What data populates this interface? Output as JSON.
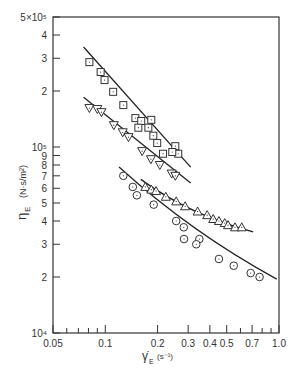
{
  "chart_data": {
    "type": "scatter",
    "title": "",
    "xlabel": "γ̇_E (s⁻¹)",
    "ylabel": "η_E (N·s/m²)",
    "xscale": "log",
    "yscale": "log",
    "xlim": [
      0.05,
      1.0
    ],
    "ylim": [
      10000,
      500000
    ],
    "grid": false,
    "legend": null,
    "x_ticks": [
      {
        "value": 0.05,
        "label": "0.05"
      },
      {
        "value": 0.1,
        "label": "0.1"
      },
      {
        "value": 0.2,
        "label": "0.2"
      },
      {
        "value": 0.3,
        "label": "0.3"
      },
      {
        "value": 0.4,
        "label": "0.4"
      },
      {
        "value": 0.5,
        "label": "0.5"
      },
      {
        "value": 0.7,
        "label": "0.7"
      },
      {
        "value": 1.0,
        "label": "1.0"
      }
    ],
    "x_minor_ticks": [
      0.06,
      0.07,
      0.08,
      0.09,
      0.6,
      0.8,
      0.9
    ],
    "y_ticks": [
      {
        "value": 10000,
        "label": "10⁴"
      },
      {
        "value": 20000,
        "label": "2"
      },
      {
        "value": 30000,
        "label": "3"
      },
      {
        "value": 40000,
        "label": "4"
      },
      {
        "value": 50000,
        "label": "5"
      },
      {
        "value": 60000,
        "label": "6"
      },
      {
        "value": 70000,
        "label": "7"
      },
      {
        "value": 80000,
        "label": "8"
      },
      {
        "value": 90000,
        "label": "9"
      },
      {
        "value": 100000,
        "label": "10⁵"
      },
      {
        "value": 200000,
        "label": "2"
      },
      {
        "value": 300000,
        "label": "3"
      },
      {
        "value": 400000,
        "label": "4"
      },
      {
        "value": 500000,
        "label": "5×10⁵"
      }
    ],
    "series": [
      {
        "name": "squares",
        "marker": "square",
        "points": [
          [
            0.081,
            286000
          ],
          [
            0.094,
            253000
          ],
          [
            0.099,
            229000
          ],
          [
            0.111,
            198000
          ],
          [
            0.127,
            168000
          ],
          [
            0.149,
            143000
          ],
          [
            0.161,
            138000
          ],
          [
            0.184,
            140000
          ],
          [
            0.155,
            127000
          ],
          [
            0.177,
            127000
          ],
          [
            0.189,
            115000
          ],
          [
            0.199,
            105000
          ],
          [
            0.215,
            92000
          ],
          [
            0.253,
            101000
          ],
          [
            0.263,
            92000
          ],
          [
            0.243,
            94000
          ]
        ],
        "fit_line": [
          [
            0.075,
            345000
          ],
          [
            0.31,
            78000
          ]
        ]
      },
      {
        "name": "triangles-down",
        "marker": "triangle-down",
        "points": [
          [
            0.081,
            162000
          ],
          [
            0.09,
            160000
          ],
          [
            0.095,
            154000
          ],
          [
            0.112,
            131000
          ],
          [
            0.126,
            120000
          ],
          [
            0.136,
            113000
          ],
          [
            0.163,
            95000
          ],
          [
            0.183,
            86000
          ],
          [
            0.206,
            80000
          ],
          [
            0.241,
            72000
          ],
          [
            0.253,
            70000
          ]
        ],
        "fit_line": [
          [
            0.075,
            185000
          ],
          [
            0.31,
            64000
          ]
        ]
      },
      {
        "name": "triangles-up",
        "marker": "triangle-up",
        "points": [
          [
            0.17,
            61000
          ],
          [
            0.184,
            59000
          ],
          [
            0.196,
            58000
          ],
          [
            0.223,
            54000
          ],
          [
            0.256,
            51000
          ],
          [
            0.288,
            48000
          ],
          [
            0.34,
            45000
          ],
          [
            0.386,
            43000
          ],
          [
            0.418,
            41000
          ],
          [
            0.451,
            40000
          ],
          [
            0.487,
            39000
          ],
          [
            0.509,
            38000
          ],
          [
            0.558,
            37000
          ],
          [
            0.61,
            37000
          ]
        ],
        "fit_line": [
          [
            0.16,
            67000
          ],
          [
            0.71,
            35000
          ]
        ]
      },
      {
        "name": "circles",
        "marker": "circle",
        "points": [
          [
            0.127,
            70000
          ],
          [
            0.144,
            61000
          ],
          [
            0.152,
            55000
          ],
          [
            0.19,
            49000
          ],
          [
            0.256,
            40000
          ],
          [
            0.283,
            37000
          ],
          [
            0.284,
            32000
          ],
          [
            0.348,
            32000
          ],
          [
            0.334,
            30000
          ],
          [
            0.451,
            25000
          ],
          [
            0.549,
            23000
          ],
          [
            0.687,
            21000
          ],
          [
            0.773,
            20000
          ]
        ],
        "fit_line": [
          [
            0.12,
            78000
          ],
          [
            0.97,
            19500
          ]
        ]
      }
    ]
  },
  "labels": {
    "x_axis_title": "γ̇",
    "x_axis_sub": "E",
    "x_axis_units": "(s⁻¹)",
    "y_axis_title": "η",
    "y_axis_sub": "E",
    "y_axis_units": "(N·s/m²)"
  }
}
